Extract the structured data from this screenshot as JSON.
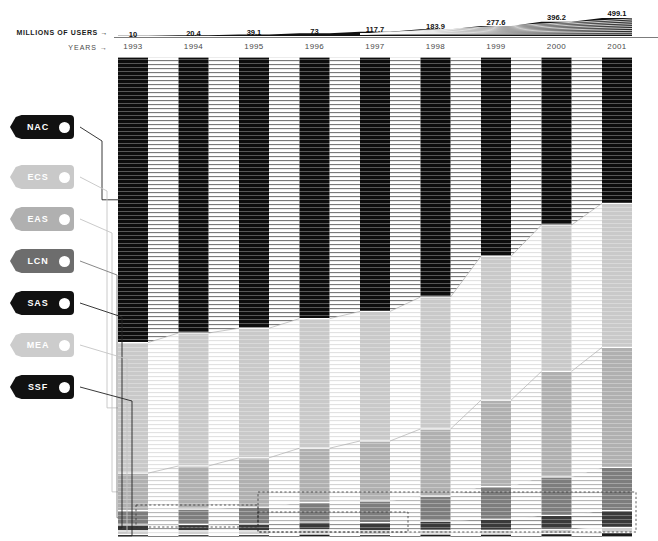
{
  "axes": {
    "users_label": "MILLIONS OF USERS →",
    "years_label": "YEARS →"
  },
  "chart_data": {
    "type": "area",
    "title": "",
    "subtitle": "",
    "xlabel": "YEARS →",
    "ylabel": "MILLIONS OF USERS →",
    "grid": false,
    "legend_position": "left",
    "categories": [
      "1993",
      "1994",
      "1995",
      "1996",
      "1997",
      "1998",
      "1999",
      "2000",
      "2001"
    ],
    "totals": [
      10,
      20.4,
      39.1,
      73,
      117.7,
      183.9,
      277.6,
      396.2,
      499.1
    ],
    "total_labels": [
      "10",
      "20.4",
      "39.1",
      "73",
      "117.7",
      "183.9",
      "277.6",
      "396.2",
      "499.1"
    ],
    "series": [
      {
        "name": "NAC",
        "color": "#0d0d0d",
        "shares": [
          0.595,
          0.575,
          0.565,
          0.545,
          0.53,
          0.5,
          0.415,
          0.35,
          0.305
        ],
        "values": [
          5.95,
          11.7,
          22.1,
          39.8,
          62.4,
          92.0,
          115.2,
          138.7,
          152.2
        ]
      },
      {
        "name": "ECS",
        "color": "#c9c9c9",
        "shares": [
          0.272,
          0.277,
          0.27,
          0.27,
          0.27,
          0.275,
          0.3,
          0.305,
          0.3
        ],
        "values": [
          2.72,
          5.65,
          10.6,
          19.7,
          31.8,
          50.6,
          83.3,
          120.8,
          149.7
        ]
      },
      {
        "name": "EAS",
        "color": "#b0b0b0",
        "shares": [
          0.078,
          0.09,
          0.103,
          0.113,
          0.125,
          0.14,
          0.18,
          0.22,
          0.25
        ],
        "values": [
          0.78,
          1.84,
          4.03,
          8.25,
          14.7,
          25.7,
          50.0,
          87.2,
          124.8
        ]
      },
      {
        "name": "LCN",
        "color": "#7d7d7d",
        "shares": [
          0.03,
          0.032,
          0.035,
          0.041,
          0.045,
          0.052,
          0.068,
          0.08,
          0.09
        ],
        "values": [
          0.3,
          0.65,
          1.37,
          2.99,
          5.3,
          9.56,
          18.9,
          31.7,
          44.9
        ]
      },
      {
        "name": "SAS",
        "color": "#3a3a3a",
        "shares": [
          0.012,
          0.013,
          0.014,
          0.016,
          0.017,
          0.019,
          0.023,
          0.029,
          0.035
        ],
        "values": [
          0.12,
          0.27,
          0.55,
          1.17,
          2.0,
          3.49,
          6.38,
          11.5,
          17.5
        ]
      },
      {
        "name": "MEA",
        "color": "#d0d0d0",
        "shares": [
          0.008,
          0.008,
          0.008,
          0.009,
          0.008,
          0.008,
          0.008,
          0.009,
          0.011
        ],
        "values": [
          0.08,
          0.16,
          0.31,
          0.66,
          0.94,
          1.47,
          2.22,
          3.57,
          5.49
        ]
      },
      {
        "name": "SSF",
        "color": "#1a1a1a",
        "shares": [
          0.005,
          0.005,
          0.005,
          0.006,
          0.005,
          0.006,
          0.006,
          0.007,
          0.009
        ],
        "values": [
          0.05,
          0.1,
          0.2,
          0.44,
          0.59,
          1.1,
          1.67,
          2.77,
          4.49
        ]
      }
    ]
  },
  "tags": [
    {
      "label": "NAC",
      "color": "#111111",
      "text_color": "#ffffff",
      "top": 115
    },
    {
      "label": "ECS",
      "color": "#c9c9c9",
      "text_color": "#ffffff",
      "top": 165
    },
    {
      "label": "EAS",
      "color": "#b0b0b0",
      "text_color": "#ffffff",
      "top": 207
    },
    {
      "label": "LCN",
      "color": "#6d6d6d",
      "text_color": "#ffffff",
      "top": 249
    },
    {
      "label": "SAS",
      "color": "#111111",
      "text_color": "#ffffff",
      "top": 291
    },
    {
      "label": "MEA",
      "color": "#cccccc",
      "text_color": "#ffffff",
      "top": 333
    },
    {
      "label": "SSF",
      "color": "#111111",
      "text_color": "#ffffff",
      "top": 375
    }
  ]
}
